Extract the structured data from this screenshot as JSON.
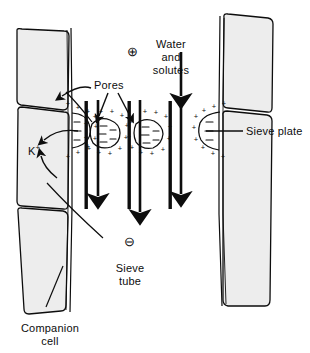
{
  "figure": {
    "background_color": "#ffffff",
    "ink_color": "#0d0d0d",
    "cell_fill_color": "#eeeeee",
    "width": 310,
    "height": 353
  },
  "labels": {
    "pores": "Pores",
    "water_and_solutes_line1": "Water",
    "water_and_solutes_line2": "and",
    "water_and_solutes_line3": "solutes",
    "sieve_plate": "Sieve plate",
    "sieve_tube_line1": "Sieve",
    "sieve_tube_line2": "tube",
    "companion_cell_line1": "Companion",
    "companion_cell_line2": "cell",
    "potassium_ion_base": "K",
    "potassium_ion_charge": "+"
  },
  "symbols": {
    "plus_circle": "⊕",
    "minus_circle": "⊖",
    "membrane_outer_charge": "+",
    "membrane_inner_charge": "–"
  },
  "annotations": {
    "plus_circle_meaning": "positive charge outside sieve tube",
    "minus_circle_meaning": "negative charge inside sieve tube",
    "flow_direction": "downward"
  }
}
